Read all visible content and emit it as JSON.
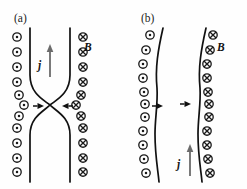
{
  "figure": {
    "width": 247,
    "height": 189,
    "background": "#ffffff",
    "ink_color": "#1a1a1a",
    "arrow_gray": "#6b6b6b"
  },
  "panels": [
    {
      "id": "panel-a",
      "label": "(a)",
      "label_x": 14,
      "label_y": 22,
      "description": "Pinched current sheet forming an X-point neck; magnetic field out of page on the left, into page on the right; current density j directed upward; inflow arrows converge horizontally at the neck.",
      "field_label": "B",
      "field_label_x": 84,
      "field_label_y": 51,
      "current_label": "j",
      "current_label_x": 38,
      "current_label_y": 69,
      "current_arrow": {
        "direction": "up",
        "x": 50,
        "y_tail": 77,
        "y_head": 44,
        "color": "#6b6b6b"
      },
      "inflow_arrows": [
        {
          "direction": "right",
          "x_tail": 33,
          "x_head": 44,
          "y": 106,
          "color": "#111111"
        },
        {
          "direction": "left",
          "x_tail": 73,
          "x_head": 62,
          "y": 106,
          "color": "#111111"
        }
      ],
      "left_boundary": "M 30 28 L 30 75 C 30 94 44 100 50 105 C 44 111 30 117 30 135 L 30 182",
      "right_boundary": "M 70 28 L 70 75 C 70 94 56 100 50 105 C 56 111 70 117 70 135 L 70 182",
      "dots": [
        {
          "x": 17,
          "y": 37
        },
        {
          "x": 17,
          "y": 52
        },
        {
          "x": 17,
          "y": 67
        },
        {
          "x": 17,
          "y": 82
        },
        {
          "x": 19,
          "y": 95
        },
        {
          "x": 24,
          "y": 105
        },
        {
          "x": 19,
          "y": 116
        },
        {
          "x": 17,
          "y": 128
        },
        {
          "x": 17,
          "y": 143
        },
        {
          "x": 17,
          "y": 158
        },
        {
          "x": 17,
          "y": 172
        }
      ],
      "crosses": [
        {
          "x": 83,
          "y": 37
        },
        {
          "x": 83,
          "y": 52
        },
        {
          "x": 83,
          "y": 67
        },
        {
          "x": 83,
          "y": 82
        },
        {
          "x": 81,
          "y": 95
        },
        {
          "x": 76,
          "y": 105
        },
        {
          "x": 81,
          "y": 116
        },
        {
          "x": 83,
          "y": 128
        },
        {
          "x": 83,
          "y": 143
        },
        {
          "x": 83,
          "y": 158
        },
        {
          "x": 83,
          "y": 172
        }
      ]
    },
    {
      "id": "panel-b",
      "label": "(b)",
      "label_x": 141,
      "label_y": 22,
      "description": "Two wavy current sheet boundaries with magnetic field out of page on the left and into page on the right; horizontal perturbation arrows both pointing right at mid-height; current density j directed upward near the bottom.",
      "field_label": "B",
      "field_label_x": 217,
      "field_label_y": 51,
      "current_label": "j",
      "current_label_x": 177,
      "current_label_y": 168,
      "current_arrow": {
        "direction": "up",
        "x": 190,
        "y_tail": 176,
        "y_head": 144,
        "color": "#6b6b6b"
      },
      "inflow_arrows": [
        {
          "direction": "right",
          "x_tail": 152,
          "x_head": 163,
          "y": 106,
          "color": "#111111"
        },
        {
          "direction": "right",
          "x_tail": 180,
          "x_head": 191,
          "y": 104,
          "color": "#111111"
        }
      ],
      "left_boundary": "M 163 28 C 158 50 155 68 157 88 C 158 103 155 118 155 134 C 155 156 158 170 159 182",
      "right_boundary": "M 206 28 C 201 50 198 68 200 88 C 201 103 198 118 198 134 C 198 156 201 170 202 182",
      "dots": [
        {
          "x": 150,
          "y": 35
        },
        {
          "x": 146,
          "y": 50
        },
        {
          "x": 143,
          "y": 64
        },
        {
          "x": 143,
          "y": 78
        },
        {
          "x": 144,
          "y": 92
        },
        {
          "x": 145,
          "y": 104
        },
        {
          "x": 145,
          "y": 117
        },
        {
          "x": 143,
          "y": 131
        },
        {
          "x": 143,
          "y": 145
        },
        {
          "x": 144,
          "y": 159
        },
        {
          "x": 146,
          "y": 173
        }
      ],
      "crosses": [
        {
          "x": 213,
          "y": 35
        },
        {
          "x": 210,
          "y": 50
        },
        {
          "x": 207,
          "y": 64
        },
        {
          "x": 207,
          "y": 78
        },
        {
          "x": 208,
          "y": 92
        },
        {
          "x": 209,
          "y": 104
        },
        {
          "x": 209,
          "y": 117
        },
        {
          "x": 207,
          "y": 131
        },
        {
          "x": 207,
          "y": 145
        },
        {
          "x": 208,
          "y": 159
        },
        {
          "x": 210,
          "y": 173
        }
      ]
    }
  ],
  "symbols": {
    "dot_name": "field-out-of-page-symbol",
    "cross_name": "field-into-page-symbol",
    "dot_radius": 4.2,
    "cross_radius": 4.2
  }
}
